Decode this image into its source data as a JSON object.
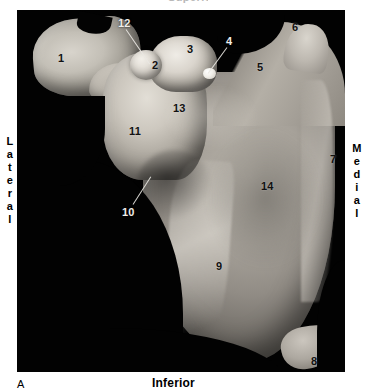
{
  "figure": {
    "panel_letter": "A",
    "top_cutoff_label": "Superior",
    "orientation": {
      "left": "Lateral",
      "right": "Medial",
      "bottom": "Inferior"
    }
  },
  "photo": {
    "subject": "scapula-posterior-view",
    "background_color": "#020202",
    "bone_color": "#b3aea6"
  },
  "labels": [
    {
      "id": "1",
      "text": "1",
      "x": 58,
      "y": 53,
      "tone": "dark"
    },
    {
      "id": "2",
      "text": "2",
      "x": 152,
      "y": 60,
      "tone": "dark"
    },
    {
      "id": "3",
      "text": "3",
      "x": 187,
      "y": 44,
      "tone": "dark"
    },
    {
      "id": "4",
      "text": "4",
      "x": 226,
      "y": 36,
      "tone": "light"
    },
    {
      "id": "5",
      "text": "5",
      "x": 257,
      "y": 62,
      "tone": "dark"
    },
    {
      "id": "6",
      "text": "6",
      "x": 292,
      "y": 22,
      "tone": "dark"
    },
    {
      "id": "7",
      "text": "7",
      "x": 330,
      "y": 154,
      "tone": "dark"
    },
    {
      "id": "8",
      "text": "8",
      "x": 311,
      "y": 356,
      "tone": "dark"
    },
    {
      "id": "9",
      "text": "9",
      "x": 216,
      "y": 261,
      "tone": "dark"
    },
    {
      "id": "10",
      "text": "10",
      "x": 122,
      "y": 207,
      "tone": "light"
    },
    {
      "id": "11",
      "text": "11",
      "x": 129,
      "y": 126,
      "tone": "dark"
    },
    {
      "id": "12",
      "text": "12",
      "x": 118,
      "y": 18,
      "tone": "light"
    },
    {
      "id": "13",
      "text": "13",
      "x": 173,
      "y": 103,
      "tone": "dark"
    },
    {
      "id": "14",
      "text": "14",
      "x": 261,
      "y": 181,
      "tone": "dark"
    }
  ],
  "leader_lines": [
    {
      "for": "12",
      "x1": 126,
      "y1": 29,
      "x2": 150,
      "y2": 64
    },
    {
      "for": "4",
      "x1": 227,
      "y1": 47,
      "x2": 208,
      "y2": 73
    },
    {
      "for": "10",
      "x1": 133,
      "y1": 204,
      "x2": 151,
      "y2": 176
    }
  ]
}
